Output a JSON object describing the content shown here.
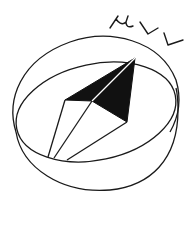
{
  "logo": {
    "text": "μVV",
    "stroke_color": "#1a1a1a",
    "fill_color": "#111111",
    "background": "#ffffff"
  }
}
